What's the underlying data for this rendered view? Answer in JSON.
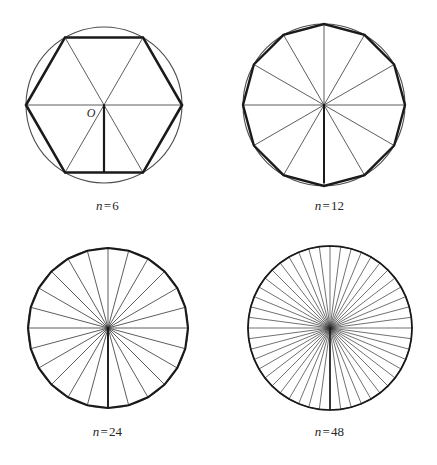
{
  "figure": {
    "background_color": "#ffffff",
    "width": 437,
    "height": 465,
    "ink_color": "#1a1a1a",
    "thin_color": "#333333",
    "circle_color": "#4d4d4d"
  },
  "chart_data": {
    "type": "diagram",
    "panels": [
      {
        "id": "panel-n6",
        "caption_variable": "n",
        "caption_equals": "=",
        "caption_value": "6",
        "caption": "n = 6",
        "sides": 6,
        "center_label": "O",
        "show_center_label": true,
        "circle_center_x": 104,
        "circle_center_y": 105,
        "circle_radius": 78,
        "polygon_radius": 78,
        "rotation_deg": 0,
        "circle_stroke_width": 1.1,
        "polygon_stroke_width": 2.6,
        "radius_stroke_width": 0.8,
        "apothem_stroke_width": 2.2,
        "show_apothem": true,
        "apothem_angle_deg": 90
      },
      {
        "id": "panel-n12",
        "caption_variable": "n",
        "caption_equals": "=",
        "caption_value": "12",
        "caption": "n = 12",
        "sides": 12,
        "center_label": "",
        "show_center_label": false,
        "circle_center_x": 324,
        "circle_center_y": 105,
        "circle_radius": 81,
        "polygon_radius": 81,
        "rotation_deg": 0,
        "circle_stroke_width": 1.1,
        "polygon_stroke_width": 2.4,
        "radius_stroke_width": 0.8,
        "apothem_stroke_width": 2.0,
        "show_apothem": true,
        "apothem_angle_deg": 90
      },
      {
        "id": "panel-n24",
        "caption_variable": "n",
        "caption_equals": "=",
        "caption_value": "24",
        "caption": "n = 24",
        "sides": 24,
        "center_label": "",
        "show_center_label": false,
        "circle_center_x": 108,
        "circle_center_y": 328,
        "circle_radius": 80,
        "polygon_radius": 80,
        "rotation_deg": 0,
        "circle_stroke_width": 1.1,
        "polygon_stroke_width": 2.1,
        "radius_stroke_width": 0.8,
        "apothem_stroke_width": 1.9,
        "show_apothem": true,
        "apothem_angle_deg": 90
      },
      {
        "id": "panel-n48",
        "caption_variable": "n",
        "caption_equals": "=",
        "caption_value": "48",
        "caption": "n = 48",
        "sides": 48,
        "center_label": "",
        "show_center_label": false,
        "circle_center_x": 330,
        "circle_center_y": 328,
        "circle_radius": 82,
        "polygon_radius": 82,
        "rotation_deg": 0,
        "circle_stroke_width": 1.2,
        "polygon_stroke_width": 1.7,
        "radius_stroke_width": 0.7,
        "apothem_stroke_width": 1.6,
        "show_apothem": true,
        "apothem_angle_deg": 90
      }
    ],
    "caption_positions": [
      {
        "x": 0,
        "y": 198,
        "width": 215
      },
      {
        "x": 222,
        "y": 198,
        "width": 215
      },
      {
        "x": 0,
        "y": 424,
        "width": 215
      },
      {
        "x": 222,
        "y": 424,
        "width": 215
      }
    ]
  }
}
